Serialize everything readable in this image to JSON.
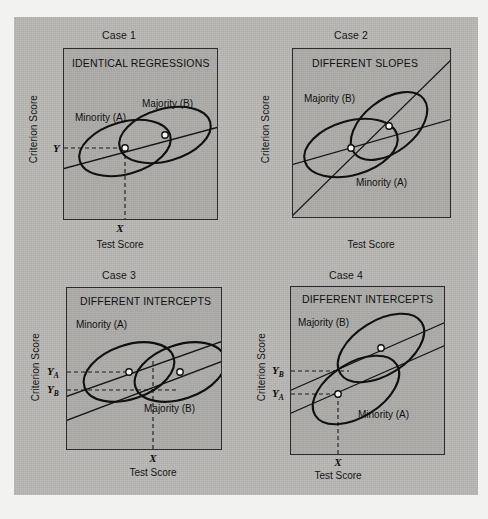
{
  "figure": {
    "background_color": "#b8b7b4",
    "page_color": "#f2f2f0"
  },
  "chart_data": {
    "type": "scatter",
    "xlabel": "Test Score",
    "ylabel": "Criterion Score",
    "grid": false,
    "legend": "inline-annotations",
    "panels": [
      {
        "case_label": "Case 1",
        "heading": "IDENTICAL REGRESSIONS",
        "xlabel": "Test Score",
        "ylabel": "Criterion Score",
        "x_tick": "X",
        "y_ticks": [
          "Y"
        ],
        "groups": [
          {
            "name": "Minority (A)",
            "label_pos": "upper-left",
            "centroid": {
              "x": 0.38,
              "y": 0.47
            }
          },
          {
            "name": "Majority (B)",
            "label_pos": "upper-right",
            "centroid": {
              "x": 0.62,
              "y": 0.57
            }
          }
        ],
        "regression_lines": [
          {
            "name": "common",
            "slope": 0.3,
            "note": "single line through both centroids"
          }
        ],
        "note": "One common regression line passes through both group centroids; a single test score X predicts a single criterion score Y for both groups."
      },
      {
        "case_label": "Case 2",
        "heading": "DIFFERENT SLOPES",
        "xlabel": "Test Score",
        "ylabel": "Criterion Score",
        "x_tick": "",
        "y_ticks": [],
        "groups": [
          {
            "name": "Majority (B)",
            "label_pos": "upper-left",
            "centroid": {
              "x": 0.62,
              "y": 0.6
            }
          },
          {
            "name": "Minority (A)",
            "label_pos": "lower-right",
            "centroid": {
              "x": 0.38,
              "y": 0.45
            }
          }
        ],
        "regression_lines": [
          {
            "name": "A",
            "slope": 0.3,
            "note": "flatter line"
          },
          {
            "name": "B",
            "slope": 0.85,
            "note": "steeper line"
          }
        ],
        "note": "The two regression lines cross; slopes differ between groups."
      },
      {
        "case_label": "Case 3",
        "heading": "DIFFERENT INTERCEPTS",
        "xlabel": "Test Score",
        "ylabel": "Criterion Score",
        "x_tick": "X",
        "y_ticks": [
          "YA",
          "YB"
        ],
        "groups": [
          {
            "name": "Minority (A)",
            "label_pos": "upper-left",
            "centroid": {
              "x": 0.38,
              "y": 0.52
            }
          },
          {
            "name": "Majority (B)",
            "label_pos": "lower-right",
            "centroid": {
              "x": 0.63,
              "y": 0.52
            }
          }
        ],
        "regression_lines": [
          {
            "name": "A",
            "slope": 0.36,
            "note": "upper parallel line"
          },
          {
            "name": "B",
            "slope": 0.36,
            "note": "lower parallel line"
          }
        ],
        "note": "Parallel regression lines with different intercepts; at test score X the minority predicted score YA exceeds the majority predicted score YB."
      },
      {
        "case_label": "Case 4",
        "heading": "DIFFERENT INTERCEPTS",
        "xlabel": "Test Score",
        "ylabel": "Criterion Score",
        "x_tick": "X",
        "y_ticks": [
          "YB",
          "YA"
        ],
        "groups": [
          {
            "name": "Majority (B)",
            "label_pos": "upper-left",
            "centroid": {
              "x": 0.58,
              "y": 0.66
            }
          },
          {
            "name": "Minority (A)",
            "label_pos": "lower-right",
            "centroid": {
              "x": 0.42,
              "y": 0.45
            }
          }
        ],
        "regression_lines": [
          {
            "name": "B",
            "slope": 0.42,
            "note": "upper parallel line"
          },
          {
            "name": "A",
            "slope": 0.42,
            "note": "lower parallel line"
          }
        ],
        "note": "Parallel regression lines with different intercepts; at test score X the majority predicted score YB exceeds the minority predicted score YA."
      }
    ]
  }
}
